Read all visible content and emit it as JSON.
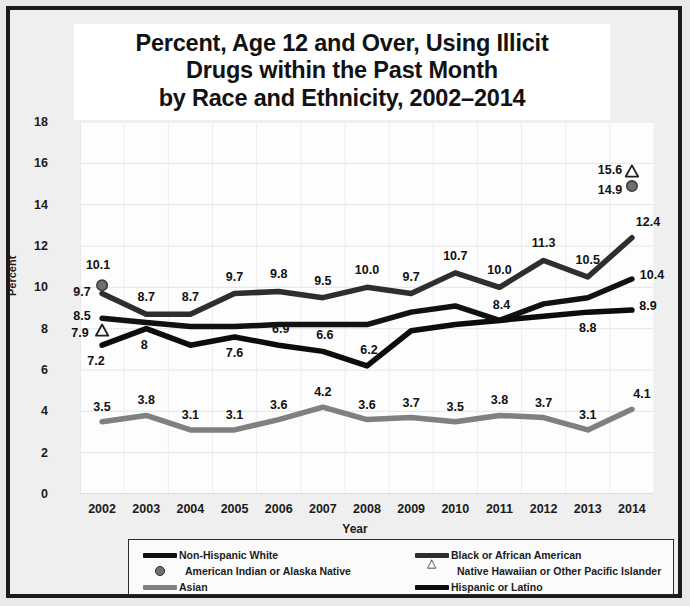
{
  "chart_data": {
    "type": "line",
    "title": "Percent, Age 12 and Over, Using Illicit Drugs within the Past Month by Race and Ethnicity, 2002–2014",
    "title_lines": [
      "Percent, Age 12 and Over, Using Illicit",
      "Drugs within the Past Month",
      "by Race and Ethnicity, 2002–2014"
    ],
    "xlabel": "Year",
    "ylabel": "Percent",
    "categories": [
      "2002",
      "2003",
      "2004",
      "2005",
      "2006",
      "2007",
      "2008",
      "2009",
      "2010",
      "2011",
      "2012",
      "2013",
      "2014"
    ],
    "ylim": [
      0,
      18
    ],
    "yticks": [
      "0",
      "2",
      "4",
      "6",
      "8",
      "10",
      "12",
      "14",
      "16",
      "18"
    ],
    "grid": true,
    "legend_position": "bottom",
    "series": [
      {
        "name": "Non-Hispanic White",
        "style": "line",
        "color": "#111111",
        "values": [
          8.5,
          8.3,
          8.1,
          8.1,
          8.2,
          8.2,
          8.2,
          8.8,
          9.1,
          8.4,
          9.2,
          9.5,
          10.4
        ],
        "labels": [
          "8.5",
          "",
          "",
          "",
          "",
          "",
          "",
          "",
          "",
          "8.4",
          "",
          "",
          "10.4"
        ]
      },
      {
        "name": "Black or African American",
        "style": "line",
        "color": "#2e2e2e",
        "values": [
          9.7,
          8.7,
          8.7,
          9.7,
          9.8,
          9.5,
          10.0,
          9.7,
          10.7,
          10.0,
          11.3,
          10.5,
          12.4
        ],
        "labels": [
          "9.7",
          "8.7",
          "8.7",
          "9.7",
          "9.8",
          "9.5",
          "10.0",
          "9.7",
          "10.7",
          "10.0",
          "11.3",
          "10.5",
          "12.4"
        ]
      },
      {
        "name": "American Indian or Alaska Native",
        "style": "marker-dot",
        "color": "#6f6f6f",
        "values": [
          10.1,
          null,
          null,
          null,
          null,
          null,
          null,
          null,
          null,
          null,
          null,
          null,
          14.9
        ],
        "labels": [
          "10.1",
          "",
          "",
          "",
          "",
          "",
          "",
          "",
          "",
          "",
          "",
          "",
          "14.9"
        ]
      },
      {
        "name": "Native Hawaiian or Other Pacific Islander",
        "style": "marker-triangle",
        "color": "#1f1f1f",
        "values": [
          7.9,
          null,
          null,
          null,
          null,
          null,
          null,
          null,
          null,
          null,
          null,
          null,
          15.6
        ],
        "labels": [
          "7.9",
          "",
          "",
          "",
          "",
          "",
          "",
          "",
          "",
          "",
          "",
          "",
          "15.6"
        ]
      },
      {
        "name": "Asian",
        "style": "line",
        "color": "#808080",
        "values": [
          3.5,
          3.8,
          3.1,
          3.1,
          3.6,
          4.2,
          3.6,
          3.7,
          3.5,
          3.8,
          3.7,
          3.1,
          4.1
        ],
        "labels": [
          "3.5",
          "3.8",
          "3.1",
          "3.1",
          "3.6",
          "4.2",
          "3.6",
          "3.7",
          "3.5",
          "3.8",
          "3.7",
          "3.1",
          "4.1"
        ]
      },
      {
        "name": "Hispanic or Latino",
        "style": "line",
        "color": "#0c0c0c",
        "values": [
          7.2,
          8.0,
          7.2,
          7.6,
          7.2,
          6.9,
          6.2,
          7.9,
          8.2,
          8.4,
          8.6,
          8.8,
          8.9
        ],
        "labels": [
          "7.2",
          "8",
          "",
          "7.6",
          "6.9",
          "6.6",
          "6.2",
          "",
          "",
          "",
          "",
          "8.8",
          "8.9"
        ]
      }
    ],
    "annotations": [
      {
        "text": "10.1",
        "x": 2002,
        "y": 10.1
      },
      {
        "text": "9.7",
        "x": 2002,
        "y": 9.7
      },
      {
        "text": "8.5",
        "x": 2002,
        "y": 8.5
      },
      {
        "text": "7.9",
        "x": 2002,
        "y": 7.9
      },
      {
        "text": "7.2",
        "x": 2002,
        "y": 7.2
      },
      {
        "text": "3.5",
        "x": 2002,
        "y": 3.5
      },
      {
        "text": "15.6",
        "x": 2014,
        "y": 15.6
      },
      {
        "text": "14.9",
        "x": 2014,
        "y": 14.9
      },
      {
        "text": "12.4",
        "x": 2014,
        "y": 12.4
      },
      {
        "text": "10.4",
        "x": 2014,
        "y": 10.4
      },
      {
        "text": "8.9",
        "x": 2014,
        "y": 8.9
      },
      {
        "text": "4.1",
        "x": 2014,
        "y": 4.1
      }
    ]
  },
  "legend": {
    "items": [
      {
        "label": "Non-Hispanic White",
        "marker": "line",
        "color": "#111111"
      },
      {
        "label": "Black or African American",
        "marker": "line",
        "color": "#2e2e2e"
      },
      {
        "label": "American Indian or Alaska Native",
        "marker": "dot",
        "color": "#6f6f6f"
      },
      {
        "label": "Native Hawaiian or Other Pacific Islander",
        "marker": "triangle",
        "color": "#1f1f1f"
      },
      {
        "label": "Asian",
        "marker": "line",
        "color": "#808080"
      },
      {
        "label": "Hispanic or Latino",
        "marker": "line",
        "color": "#0c0c0c"
      }
    ]
  }
}
